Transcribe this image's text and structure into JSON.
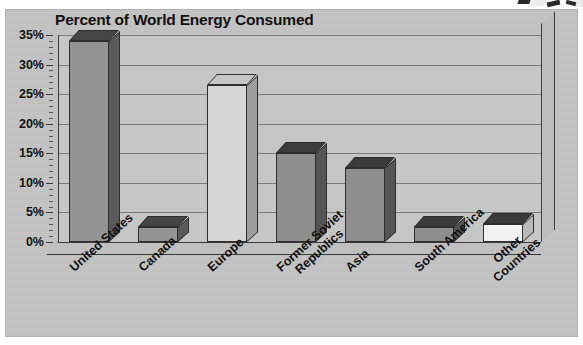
{
  "chart_data": {
    "type": "bar",
    "title": "Percent of World Energy Consumed",
    "xlabel": "",
    "ylabel": "",
    "ylim": [
      0,
      35
    ],
    "ytick_step": 5,
    "minor_ticks": true,
    "grid": true,
    "legend": "none",
    "style": "3d-column",
    "value_suffix": "%",
    "categories": [
      "United States",
      "Canada",
      "Europe",
      "Former Soviet Republics",
      "Asia",
      "South America",
      "Other Countries"
    ],
    "values": [
      34,
      2.5,
      26.5,
      15,
      12.5,
      2.5,
      3
    ],
    "bar_colors": [
      "#949494",
      "#949494",
      "#d6d6d6",
      "#8e8e8e",
      "#8e8e8e",
      "#8e8e8e",
      "#f2f2f2"
    ],
    "bar_side_colors": [
      "#5a5a5a",
      "#5a5a5a",
      "#9d9d9d",
      "#555555",
      "#555555",
      "#555555",
      "#b9b9b9"
    ],
    "bar_top_colors": [
      "#454545",
      "#454545",
      "#c6c6c6",
      "#3c3c3c",
      "#3c3c3c",
      "#3c3c3c",
      "#3a3a3a"
    ]
  },
  "axis": {
    "ticks": [
      "35%",
      "30%",
      "25%",
      "20%",
      "15%",
      "10%",
      "5%",
      "0%"
    ],
    "tick_values": [
      35,
      30,
      25,
      20,
      15,
      10,
      5,
      0
    ]
  },
  "xtick_labels": [
    {
      "line1": "United States",
      "line2": ""
    },
    {
      "line1": "Canada",
      "line2": ""
    },
    {
      "line1": "Europe",
      "line2": ""
    },
    {
      "line1": "Former Soviet",
      "line2": "Republics"
    },
    {
      "line1": "Asia",
      "line2": ""
    },
    {
      "line1": "South America",
      "line2": ""
    },
    {
      "line1": "Other",
      "line2": "Countries"
    }
  ],
  "colors": {
    "page_background": "#ffffff",
    "plate_background": "#c3c3c3",
    "plot_background": "#c6c6c6",
    "gridline": "#7b7b7b",
    "axis_line": "#3a3a3a",
    "text": "#101010"
  }
}
